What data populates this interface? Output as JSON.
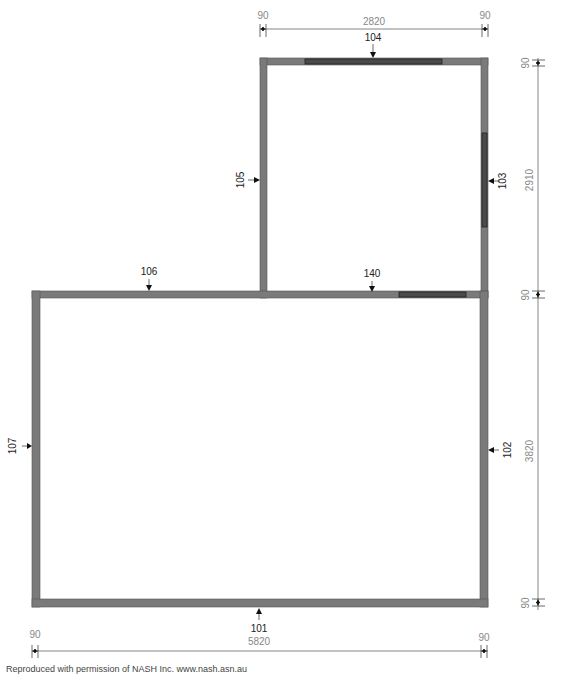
{
  "plan": {
    "wall_labels": {
      "w101": "101",
      "w102": "102",
      "w103": "103",
      "w104": "104",
      "w105": "105",
      "w106": "106",
      "w107": "107",
      "w140": "140"
    },
    "dimensions": {
      "top_left_wall": "90",
      "top_width": "2820",
      "top_right_wall": "90",
      "right_top_wall": "90",
      "right_upper_height": "2910",
      "right_mid_wall": "90",
      "right_lower_height": "3820",
      "right_bottom_wall": "90",
      "bottom_left_wall": "90",
      "bottom_width": "5820",
      "bottom_right_wall": "90"
    },
    "colors": {
      "wall": "#7a7a7a",
      "window": "#4a4a4a",
      "dimension_text": "#888888"
    }
  },
  "footer": {
    "credit": "Reproduced with permission of NASH Inc. www.nash.asn.au"
  }
}
